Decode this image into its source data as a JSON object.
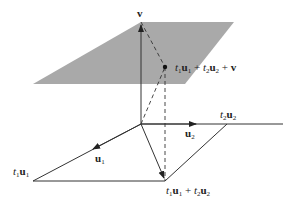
{
  "diagram": {
    "colors": {
      "plane_fill": "#a9a9a9",
      "line": "#333333",
      "background": "#ffffff"
    },
    "points": {
      "origin": [
        141,
        124
      ],
      "v": [
        141,
        22
      ],
      "p": [
        165,
        67
      ],
      "t1u1": [
        33,
        181
      ],
      "t2u2": [
        227,
        124
      ],
      "sum": [
        165,
        181
      ],
      "u1_arrow": [
        94,
        148
      ],
      "u2_arrow": [
        195,
        124
      ],
      "u2_axis_end": [
        283,
        124
      ]
    },
    "plane_polygon": [
      [
        33,
        84
      ],
      [
        141,
        22
      ],
      [
        234,
        22
      ],
      [
        185,
        84
      ]
    ],
    "labels": {
      "v": {
        "text": "v"
      },
      "point_p": {
        "t": "t",
        "s1": "1",
        "u": "u",
        "s2": "1",
        "plus1": " + ",
        "t2": "t",
        "s3": "2",
        "u2": "u",
        "s4": "2",
        "plus2": " + ",
        "v": "v"
      },
      "u1": {
        "u": "u",
        "s": "1"
      },
      "u2": {
        "u": "u",
        "s": "2"
      },
      "t1u1": {
        "t": "t",
        "s1": "1",
        "u": "u",
        "s2": "1"
      },
      "t2u2": {
        "t": "t",
        "s1": "2",
        "u": "u",
        "s2": "2"
      },
      "sum": {
        "t": "t",
        "s1": "1",
        "u": "u",
        "s2": "1",
        "plus": " + ",
        "t2": "t",
        "s3": "2",
        "u2": "u",
        "s4": "2"
      }
    }
  }
}
